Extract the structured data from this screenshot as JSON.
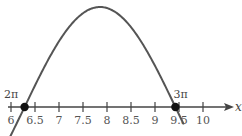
{
  "chart_data": {
    "type": "line",
    "title": "",
    "xlabel": "x",
    "ylabel": "",
    "function": "y = sin(x)",
    "xlim": [
      6,
      10.3
    ],
    "ylim": [
      -0.3,
      1
    ],
    "grid": false,
    "x_ticks": [
      6,
      6.5,
      7,
      7.5,
      8,
      8.5,
      9,
      9.5,
      10
    ],
    "tick_labels": [
      "6",
      "6.5",
      "7",
      "7.5",
      "8",
      "8.5",
      "9",
      "9.5",
      "10"
    ],
    "series": [
      {
        "name": "sin(x)",
        "x": [
          6.0,
          6.283,
          6.5,
          7.0,
          7.5,
          7.854,
          8.0,
          8.5,
          9.0,
          9.425,
          9.6
        ],
        "values": [
          -0.28,
          0.0,
          0.215,
          0.657,
          0.938,
          1.0,
          0.989,
          0.798,
          0.412,
          0.0,
          -0.174
        ]
      }
    ],
    "points": [
      {
        "x": 6.283,
        "y": 0,
        "label": "2π"
      },
      {
        "x": 9.425,
        "y": 0,
        "label": "3π"
      }
    ],
    "color": "#555555"
  }
}
